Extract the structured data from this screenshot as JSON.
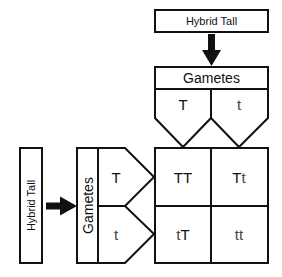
{
  "diagram": {
    "type": "punnett-square",
    "top_parent": {
      "label": "Hybrid Tall"
    },
    "left_parent": {
      "label": "Hybrid Tall"
    },
    "top_gametes": {
      "header": "Gametes",
      "alleles": [
        "T",
        "t"
      ]
    },
    "left_gametes": {
      "header": "Gametes",
      "alleles": [
        "T",
        "t"
      ]
    },
    "grid": {
      "rows": [
        {
          "cells": [
            {
              "first": "T",
              "second": "T"
            },
            {
              "first": "T",
              "second": "t"
            }
          ]
        },
        {
          "cells": [
            {
              "first": "t",
              "second": "T"
            },
            {
              "first": "t",
              "second": "t"
            }
          ]
        }
      ]
    },
    "colors": {
      "stroke": "#111111",
      "background": "#ffffff"
    }
  }
}
